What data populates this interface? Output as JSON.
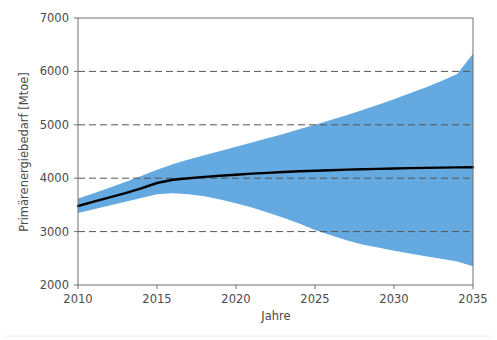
{
  "chart_data": {
    "type": "area",
    "title": "",
    "subtitle": "",
    "xlabel": "Jahre",
    "ylabel": "Primärenergiebedarf [Mtoe]",
    "xlim": [
      2010,
      2035
    ],
    "ylim": [
      2000,
      7000
    ],
    "xticks": [
      2010,
      2015,
      2020,
      2025,
      2030,
      2035
    ],
    "xtick_labels": [
      "2010",
      "2015",
      "2020",
      "2025",
      "2030",
      "2035"
    ],
    "yticks": [
      2000,
      3000,
      4000,
      5000,
      6000,
      7000
    ],
    "ytick_labels": [
      "2000",
      "3000",
      "4000",
      "5000",
      "6000",
      "7000"
    ],
    "grid": "horizontal-dashed",
    "legend": "none",
    "band_color": "#64A9DF",
    "line_color": "#000000",
    "axis_color": "#6E6E6E",
    "grid_color": "#555555",
    "background_color": "#FFFFFF",
    "x": [
      2010,
      2011,
      2012,
      2013,
      2014,
      2015,
      2016,
      2017,
      2018,
      2019,
      2020,
      2021,
      2022,
      2023,
      2024,
      2025,
      2026,
      2027,
      2028,
      2029,
      2030,
      2031,
      2032,
      2033,
      2034,
      2035
    ],
    "series": [
      {
        "name": "Zentrale Projektion",
        "role": "line",
        "values": [
          3480,
          3560,
          3640,
          3720,
          3810,
          3910,
          3970,
          4000,
          4025,
          4045,
          4065,
          4085,
          4100,
          4115,
          4130,
          4140,
          4150,
          4160,
          4168,
          4175,
          4182,
          4188,
          4193,
          4198,
          4202,
          4205
        ]
      },
      {
        "name": "Obere Bandbreite",
        "role": "band-upper",
        "values": [
          3620,
          3720,
          3820,
          3930,
          4040,
          4160,
          4260,
          4350,
          4430,
          4510,
          4590,
          4670,
          4750,
          4830,
          4915,
          5000,
          5090,
          5180,
          5275,
          5375,
          5480,
          5590,
          5700,
          5820,
          5950,
          6330
        ]
      },
      {
        "name": "Untere Bandbreite",
        "role": "band-lower",
        "values": [
          3350,
          3420,
          3490,
          3560,
          3630,
          3700,
          3720,
          3700,
          3660,
          3600,
          3530,
          3450,
          3360,
          3260,
          3150,
          3030,
          2930,
          2840,
          2760,
          2700,
          2640,
          2590,
          2540,
          2490,
          2440,
          2350
        ]
      }
    ],
    "annotations": []
  },
  "axes": {
    "y_axis_title": "Primärenergiebedarf [Mtoe]",
    "x_axis_title": "Jahre"
  }
}
